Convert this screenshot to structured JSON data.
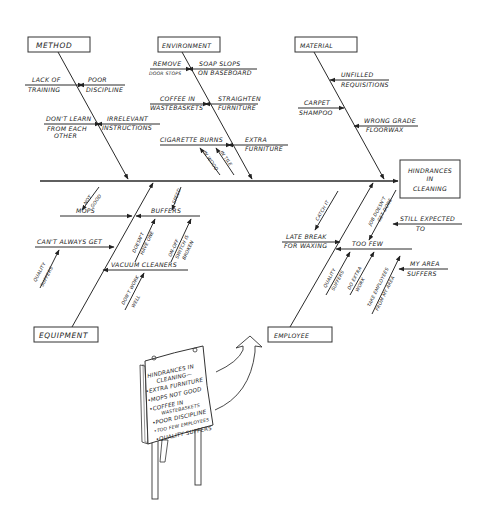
{
  "effect": {
    "line1": "HINDRANCES",
    "line2": "IN",
    "line3": "CLEANING"
  },
  "categories": {
    "method": "METHOD",
    "environment": "ENVIRONMENT",
    "material": "MATERIAL",
    "equipment": "EQUIPMENT",
    "employee": "EMPLOYEE"
  },
  "method_causes": {
    "lack_of": "LACK OF",
    "training": "TRAINING",
    "poor": "POOR",
    "discipline": "DISCIPLINE",
    "dont_learn": "DON'T LEARN",
    "from_each": "FROM EACH",
    "other": "OTHER",
    "irrelevant": "IRRELEVANT",
    "instructions": "INSTRUCTIONS"
  },
  "environment_causes": {
    "remove": "REMOVE",
    "door_stops": "DOOR STOPS",
    "soap_slops": "SOAP SLOPS",
    "on_baseboard": "ON BASEBOARD",
    "coffee_in": "COFFEE IN",
    "wastebaskets": "WASTEBASKETS",
    "straighten": "STRAIGHTEN",
    "furniture": "FURNITURE",
    "cigarette_burns": "CIGARETTE BURNS",
    "extra": "EXTRA",
    "extra_furniture": "FURNITURE",
    "in_wood": "IN WOOD",
    "in_tile": "IN TILE"
  },
  "material_causes": {
    "unfilled": "UNFILLED",
    "requisitions": "REQUISITIONS",
    "carpet": "CARPET",
    "shampoo": "SHAMPOO",
    "wrong_grade": "WRONG GRADE",
    "floorwax": "FLOORWAX"
  },
  "equipment_causes": {
    "not": "NOT",
    "good": "GOOD",
    "mops": "MOPS",
    "speed": "SPEED",
    "buffers": "BUFFERS",
    "cant_always_get": "CAN'T ALWAYS GET",
    "quality": "QUALITY",
    "suffers": "SUFFERS",
    "doesnt": "DOESN'T",
    "have_one": "HAVE ONE",
    "on_off": "ON-OFF",
    "switch_is": "SWITCH IS",
    "broken": "BROKEN",
    "vacuum_cleaners": "VACUUM CLEANERS",
    "dont_work": "DON'T WORK",
    "well": "WELL"
  },
  "employee_causes": {
    "catch_it": "CATCH IT",
    "job_doesnt": "JOB DOESN'T",
    "get_done": "GET DONE",
    "still_expected": "STILL EXPECTED",
    "to": "TO",
    "late_break": "LATE BREAK",
    "for_waxing": "FOR WAXING",
    "too_few": "TOO FEW",
    "quality": "QUALITY",
    "suffers": "SUFFERS",
    "do_extra": "DO EXTRA",
    "work": "WORK",
    "take_employees": "TAKE EMPLOYEES",
    "from_my_area": "FROM MY AREA",
    "my_area": "MY AREA",
    "suffers2": "SUFFERS"
  },
  "sign": {
    "title1": "HINDRANCES IN",
    "title2": "CLEANING—",
    "items": [
      "•EXTRA FURNITURE",
      "•MOPS NOT GOOD",
      "•COFFEE IN",
      "WASTEBASKETS",
      "•POOR DISCIPLINE",
      "•TOO FEW EMPLOYEES",
      "•QUALITY SUFFERS"
    ]
  }
}
